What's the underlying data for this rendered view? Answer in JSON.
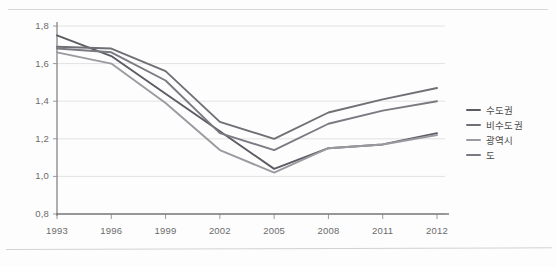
{
  "page": {
    "corner_note": "",
    "background_color": "#fdfdfd"
  },
  "legend": {
    "position": "right",
    "items": [
      {
        "label": "수도권",
        "color": "#5b5b63"
      },
      {
        "label": "비수도권",
        "color": "#6f6f76"
      },
      {
        "label": "광역시",
        "color": "#9a9aa0"
      },
      {
        "label": "도",
        "color": "#7a7a82"
      }
    ]
  },
  "axis": {
    "y_ticks": [
      "1,8",
      "1,6",
      "1,4",
      "1,2",
      "1,0",
      "0,8"
    ],
    "x_ticks": [
      "1993",
      "1996",
      "1999",
      "2002",
      "2005",
      "2008",
      "2011",
      "2012"
    ]
  },
  "chart_data": {
    "type": "line",
    "title": "",
    "xlabel": "",
    "ylabel": "",
    "categories": [
      "1993",
      "1996",
      "1999",
      "2002",
      "2005",
      "2008",
      "2011",
      "2012"
    ],
    "ylim": [
      0.8,
      1.8
    ],
    "xlim": [
      0,
      7
    ],
    "ytick_values": [
      1.8,
      1.6,
      1.4,
      1.2,
      1.0,
      0.8
    ],
    "grid": true,
    "legend_position": "right",
    "series": [
      {
        "name": "수도권",
        "color": "#5b5b63",
        "values": [
          1.75,
          1.64,
          1.44,
          1.24,
          1.04,
          1.15,
          1.17,
          1.23
        ]
      },
      {
        "name": "비수도권",
        "color": "#6f6f76",
        "values": [
          1.69,
          1.68,
          1.56,
          1.29,
          1.2,
          1.34,
          1.41,
          1.47
        ]
      },
      {
        "name": "광역시",
        "color": "#9a9aa0",
        "values": [
          1.66,
          1.6,
          1.39,
          1.14,
          1.02,
          1.15,
          1.17,
          1.22
        ]
      },
      {
        "name": "도",
        "color": "#7a7a82",
        "values": [
          1.68,
          1.66,
          1.51,
          1.23,
          1.14,
          1.28,
          1.35,
          1.4
        ]
      }
    ]
  }
}
